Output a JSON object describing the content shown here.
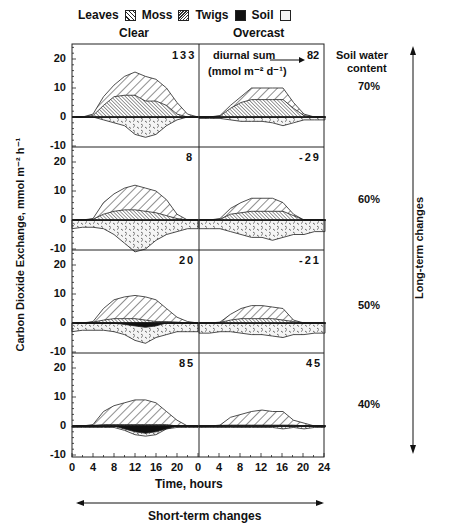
{
  "legend": {
    "items": [
      {
        "label": "Leaves",
        "pattern": "diagonal-wide"
      },
      {
        "label": "Moss",
        "pattern": "diagonal-dense"
      },
      {
        "label": "Twigs",
        "pattern": "solid-black"
      },
      {
        "label": "Soil",
        "pattern": "dotted-cross"
      }
    ]
  },
  "columns": {
    "clear": "Clear",
    "overcast": "Overcast"
  },
  "annotation": {
    "diurnal_sum": "diurnal sum",
    "units": "(mmol m⁻² d⁻¹)"
  },
  "soil_header": {
    "line1": "Soil  water",
    "line2": "content"
  },
  "rows": [
    {
      "soil_water": "70%",
      "clear_sum": "133",
      "overcast_sum": "82"
    },
    {
      "soil_water": "60%",
      "clear_sum": "8",
      "overcast_sum": "-29"
    },
    {
      "soil_water": "50%",
      "clear_sum": "20",
      "overcast_sum": "-21"
    },
    {
      "soil_water": "40%",
      "clear_sum": "85",
      "overcast_sum": "45"
    }
  ],
  "y_axis": {
    "label": "Carbon Dioxide Exchange, mmol m⁻² h⁻¹",
    "ticks": [
      "20",
      "10",
      "0",
      "-10"
    ]
  },
  "x_axis": {
    "label": "Time, hours",
    "ticks": [
      "0",
      "4",
      "8",
      "12",
      "16",
      "20",
      "0",
      "4",
      "8",
      "12",
      "16",
      "20",
      "24"
    ]
  },
  "long_term_label": "Long-term changes",
  "short_term_label": "Short-term changes",
  "chart_data": {
    "type": "area",
    "title": "",
    "xlabel": "Time, hours",
    "ylabel": "Carbon Dioxide Exchange, mmol m-2 h-1",
    "ylim": [
      -10,
      25
    ],
    "xlim": [
      0,
      24
    ],
    "grid": false,
    "legend_position": "top",
    "x": [
      0,
      2,
      4,
      6,
      8,
      10,
      12,
      14,
      16,
      18,
      20,
      22,
      24
    ],
    "panels": [
      {
        "row": "70%",
        "column": "Clear",
        "diurnal_sum": 133,
        "series": [
          {
            "name": "Leaves (total top)",
            "values": [
              0,
              0,
              1,
              7,
              11,
              14,
              15.5,
              14,
              13,
              10,
              5,
              1,
              0
            ]
          },
          {
            "name": "Moss (top)",
            "values": [
              0,
              0,
              0.5,
              4,
              7,
              7.5,
              7.5,
              5.5,
              5.5,
              4,
              1,
              0,
              0
            ]
          },
          {
            "name": "Soil (bottom)",
            "values": [
              0,
              0,
              0,
              -1,
              -2,
              -3,
              -6,
              -7,
              -6,
              -3,
              -1,
              0,
              0
            ]
          }
        ]
      },
      {
        "row": "70%",
        "column": "Overcast",
        "diurnal_sum": 82,
        "series": [
          {
            "name": "Leaves (total top)",
            "values": [
              0,
              0,
              0.5,
              4,
              7,
              10,
              10,
              10,
              10,
              5,
              1,
              0,
              0
            ]
          },
          {
            "name": "Moss (top)",
            "values": [
              0,
              0,
              0.3,
              3,
              5,
              6,
              6,
              6,
              6,
              3,
              0.5,
              0,
              0
            ]
          },
          {
            "name": "Soil (bottom)",
            "values": [
              -0.5,
              -0.5,
              -0.5,
              -1,
              -1.5,
              -1.5,
              -1.5,
              -2,
              -3,
              -2,
              -1,
              -1,
              -1
            ]
          }
        ]
      },
      {
        "row": "60%",
        "column": "Clear",
        "diurnal_sum": 8,
        "series": [
          {
            "name": "Leaves (total top)",
            "values": [
              0,
              0,
              0.5,
              6,
              9,
              11,
              12,
              11,
              10,
              7,
              2,
              0,
              0
            ]
          },
          {
            "name": "Moss (top)",
            "values": [
              0,
              0,
              0.3,
              2,
              3,
              3.5,
              3.5,
              3,
              2.5,
              1.5,
              0.5,
              0,
              0
            ]
          },
          {
            "name": "Soil (bottom)",
            "values": [
              -3,
              -2.5,
              -2.5,
              -3,
              -5,
              -8,
              -11,
              -10,
              -7,
              -5,
              -4,
              -3,
              -3
            ]
          }
        ]
      },
      {
        "row": "60%",
        "column": "Overcast",
        "diurnal_sum": -29,
        "series": [
          {
            "name": "Leaves (total top)",
            "values": [
              0,
              0,
              0.5,
              4,
              6,
              7.5,
              7.5,
              7.5,
              6,
              2,
              0,
              0,
              0
            ]
          },
          {
            "name": "Moss (top)",
            "values": [
              0,
              0,
              0.3,
              2,
              2.5,
              3,
              3,
              3,
              3,
              1.5,
              0,
              0,
              0
            ]
          },
          {
            "name": "Soil (bottom)",
            "values": [
              -3,
              -3,
              -3,
              -4,
              -5,
              -6,
              -6,
              -7,
              -6,
              -5,
              -5,
              -4,
              -4
            ]
          }
        ]
      },
      {
        "row": "50%",
        "column": "Clear",
        "diurnal_sum": 20,
        "series": [
          {
            "name": "Leaves (total top)",
            "values": [
              0,
              0,
              0.5,
              5,
              8,
              9,
              9.5,
              9,
              8,
              5,
              2,
              0.5,
              0
            ]
          },
          {
            "name": "Moss (top)",
            "values": [
              0,
              0,
              0.3,
              1,
              1.5,
              1.5,
              1.5,
              1,
              0.5,
              0.5,
              0.3,
              0,
              0
            ]
          },
          {
            "name": "Twigs (bottom)",
            "values": [
              0,
              0,
              0,
              0,
              0,
              -0.5,
              -1,
              -1.5,
              -1,
              0,
              0,
              0,
              0
            ]
          },
          {
            "name": "Soil (bottom)",
            "values": [
              -3,
              -2.5,
              -2.5,
              -2.5,
              -3,
              -4,
              -6,
              -7,
              -5,
              -4,
              -3,
              -3,
              -3
            ]
          }
        ]
      },
      {
        "row": "50%",
        "column": "Overcast",
        "diurnal_sum": -21,
        "series": [
          {
            "name": "Leaves (total top)",
            "values": [
              0,
              0,
              0.3,
              3,
              5,
              6,
              6,
              5.5,
              5,
              1,
              0,
              0,
              0
            ]
          },
          {
            "name": "Moss (top)",
            "values": [
              0,
              0,
              0.2,
              1,
              1.5,
              1.5,
              1.5,
              1.5,
              1,
              0.5,
              0,
              0,
              0
            ]
          },
          {
            "name": "Soil (bottom)",
            "values": [
              -3.5,
              -3.5,
              -3,
              -3,
              -3.5,
              -4,
              -4,
              -4.5,
              -5,
              -4,
              -4,
              -3.5,
              -3.5
            ]
          }
        ]
      },
      {
        "row": "40%",
        "column": "Clear",
        "diurnal_sum": 85,
        "series": [
          {
            "name": "Leaves (total top)",
            "values": [
              0,
              0,
              0.5,
              5,
              7,
              8,
              9,
              9,
              8,
              5,
              2,
              0,
              0
            ]
          },
          {
            "name": "Moss (top)",
            "values": [
              0,
              0,
              0.2,
              0.5,
              0.5,
              0.5,
              0.5,
              0.5,
              0.5,
              0.5,
              0,
              0,
              0
            ]
          },
          {
            "name": "Twigs (bottom)",
            "values": [
              0,
              0,
              0,
              0,
              0,
              -1,
              -2,
              -2.5,
              -2,
              -1,
              0,
              0,
              0
            ]
          },
          {
            "name": "Soil (bottom)",
            "values": [
              -0.5,
              -0.5,
              -0.5,
              -0.5,
              -0.5,
              -1.5,
              -3,
              -3.5,
              -3,
              -1,
              -0.5,
              -0.5,
              -0.5
            ]
          }
        ]
      },
      {
        "row": "40%",
        "column": "Overcast",
        "diurnal_sum": 45,
        "series": [
          {
            "name": "Leaves (total top)",
            "values": [
              0,
              0,
              0.3,
              3,
              4,
              5,
              5.5,
              5,
              5,
              2,
              1,
              0,
              0
            ]
          },
          {
            "name": "Moss (top)",
            "values": [
              0,
              0,
              0.2,
              0.3,
              0.3,
              0.3,
              0.3,
              0.3,
              0.3,
              0.3,
              0,
              0,
              0
            ]
          },
          {
            "name": "Soil (bottom)",
            "values": [
              -0.5,
              -0.5,
              -0.5,
              -0.5,
              -0.5,
              -0.5,
              -0.5,
              -0.5,
              -1,
              -0.5,
              -1,
              -0.5,
              -0.5
            ]
          }
        ]
      }
    ]
  }
}
